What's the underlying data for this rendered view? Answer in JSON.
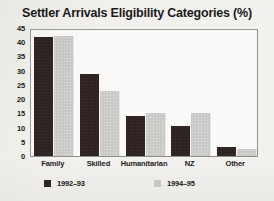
{
  "chart_data": {
    "type": "bar",
    "title": "Settler Arrivals Eligibility Categories (%)",
    "xlabel": "",
    "ylabel": "",
    "ylim": [
      0,
      45
    ],
    "yticks": [
      45,
      40,
      35,
      30,
      25,
      20,
      15,
      10,
      5,
      0
    ],
    "grid": false,
    "legend_position": "bottom",
    "categories": [
      "Family",
      "Skilled",
      "Humanitarian",
      "NZ",
      "Other"
    ],
    "series": [
      {
        "name": "1992–93",
        "color": "#2e2320",
        "values": [
          42,
          29,
          14,
          10.5,
          3
        ]
      },
      {
        "name": "1994–95",
        "color": "#c9c9c7",
        "values": [
          42.3,
          23,
          15.2,
          15.2,
          2.5
        ]
      }
    ]
  }
}
